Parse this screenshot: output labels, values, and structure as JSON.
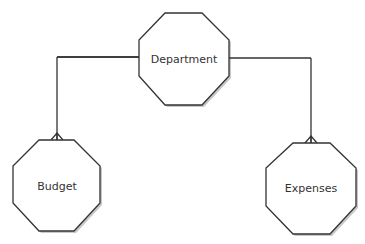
{
  "diagram": {
    "type": "entity-relationship",
    "nodes": [
      {
        "id": "department",
        "label": "Department"
      },
      {
        "id": "budget",
        "label": "Budget"
      },
      {
        "id": "expenses",
        "label": "Expenses"
      }
    ],
    "edges": [
      {
        "from": "department",
        "to": "budget",
        "cardinality_end": "crow-foot"
      },
      {
        "from": "department",
        "to": "expenses",
        "cardinality_end": "crow-foot"
      }
    ],
    "colors": {
      "stroke": "#333333",
      "fill": "#ffffff",
      "shadow": "#bbbbbb"
    }
  }
}
